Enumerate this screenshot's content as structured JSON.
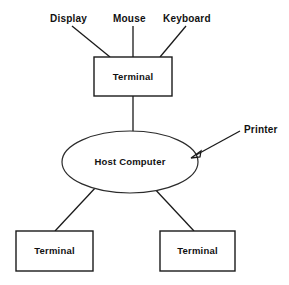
{
  "diagram": {
    "type": "node-link",
    "background_color": "#ffffff",
    "stroke_color": "#1a1a1a",
    "text_color": "#111111",
    "nodes": [
      {
        "id": "terminal-top",
        "label": "Terminal",
        "shape": "rectangle",
        "x": 94,
        "y": 57,
        "width": 78,
        "height": 39,
        "center_x": 133,
        "center_y": 76.5
      },
      {
        "id": "host-computer",
        "label": "Host Computer",
        "shape": "ellipse",
        "center_x": 130,
        "center_y": 162,
        "rx": 68,
        "ry": 31
      },
      {
        "id": "terminal-bottom-left",
        "label": "Terminal",
        "shape": "rectangle",
        "x": 16,
        "y": 231,
        "width": 77,
        "height": 40,
        "center_x": 54.5,
        "center_y": 251
      },
      {
        "id": "terminal-bottom-right",
        "label": "Terminal",
        "shape": "rectangle",
        "x": 160,
        "y": 231,
        "width": 75,
        "height": 40,
        "center_x": 197.5,
        "center_y": 251
      }
    ],
    "peripherals": [
      {
        "id": "display",
        "label": "Display",
        "text_x": 50,
        "text_y": 22,
        "line": {
          "x1": 72,
          "y1": 26,
          "x2": 110,
          "y2": 57
        }
      },
      {
        "id": "mouse",
        "label": "Mouse",
        "text_x": 113,
        "text_y": 22,
        "line": {
          "x1": 133,
          "y1": 26,
          "x2": 133,
          "y2": 57
        }
      },
      {
        "id": "keyboard",
        "label": "Keyboard",
        "text_x": 163,
        "text_y": 22,
        "line": {
          "x1": 186,
          "y1": 26,
          "x2": 160,
          "y2": 57
        }
      }
    ],
    "annotations": [
      {
        "id": "printer",
        "label": "Printer",
        "text_x": 244,
        "text_y": 133,
        "arrow": {
          "x1": 240,
          "y1": 131,
          "x2": 192,
          "y2": 157
        }
      }
    ],
    "links": [
      {
        "id": "terminal-top-to-host",
        "from": "terminal-top",
        "to": "host-computer",
        "x1": 133,
        "y1": 96,
        "x2": 133,
        "y2": 132
      },
      {
        "id": "host-to-terminal-bottom-left",
        "from": "host-computer",
        "to": "terminal-bottom-left",
        "x1": 97,
        "y1": 186,
        "x2": 55,
        "y2": 231
      },
      {
        "id": "host-to-terminal-bottom-right",
        "from": "host-computer",
        "to": "terminal-bottom-right",
        "x1": 152,
        "y1": 186,
        "x2": 194,
        "y2": 231
      }
    ]
  }
}
